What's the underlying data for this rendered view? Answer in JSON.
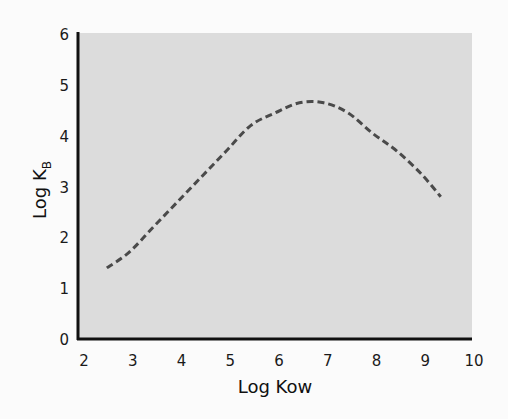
{
  "chart_data": {
    "type": "line",
    "title": "",
    "xlabel": "Log Kow",
    "ylabel": "Log K",
    "ylabel_subscript": "B",
    "xlim": [
      2,
      10
    ],
    "ylim": [
      0,
      6
    ],
    "xticks": [
      "2",
      "3",
      "4",
      "5",
      "6",
      "7",
      "8",
      "9",
      "10"
    ],
    "yticks": [
      "0",
      "1",
      "2",
      "3",
      "4",
      "5",
      "6"
    ],
    "grid": false,
    "legend": null,
    "plot_background": "#dcdcdc",
    "series": [
      {
        "name": "Log KB vs Log Kow",
        "style": "dashed",
        "color": "#4a4a4a",
        "x": [
          2.55,
          3.0,
          3.5,
          4.0,
          4.5,
          5.0,
          5.5,
          6.0,
          6.5,
          7.0,
          7.5,
          8.0,
          8.5,
          9.0,
          9.4
        ],
        "y": [
          1.4,
          1.7,
          2.2,
          2.7,
          3.2,
          3.7,
          4.2,
          4.45,
          4.65,
          4.65,
          4.45,
          4.05,
          3.7,
          3.25,
          2.8
        ]
      }
    ]
  }
}
